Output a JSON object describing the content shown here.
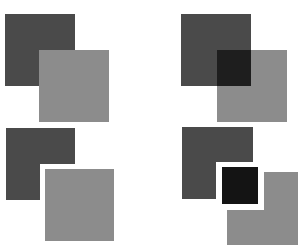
{
  "colors": {
    "background": "#ffffff",
    "dark": "#4a4a4a",
    "light": "#8c8c8c",
    "overlap": "#1e1e1e",
    "black": "#141414"
  },
  "panels": [
    {
      "name": "occlusion-light-over-dark",
      "description": "Light square occludes dark square",
      "shapes": [
        {
          "name": "dark-square",
          "x": 5,
          "y": 14,
          "w": 70,
          "h": 72,
          "fill": "dark"
        },
        {
          "name": "light-square",
          "x": 39,
          "y": 50,
          "w": 70,
          "h": 72,
          "fill": "light"
        }
      ]
    },
    {
      "name": "transparency-overlap",
      "description": "Two squares with darker overlap region",
      "shapes": [
        {
          "name": "dark-square",
          "x": 181,
          "y": 14,
          "w": 70,
          "h": 72,
          "fill": "dark"
        },
        {
          "name": "light-square",
          "x": 217,
          "y": 50,
          "w": 70,
          "h": 72,
          "fill": "light"
        },
        {
          "name": "overlap-region",
          "x": 217,
          "y": 50,
          "w": 34,
          "h": 36,
          "fill": "overlap"
        }
      ]
    },
    {
      "name": "separated-l-shape",
      "description": "Dark L-shape and light square separated by white gap",
      "shapes": [
        {
          "name": "dark-l-shape-top",
          "x": 6,
          "y": 128,
          "w": 69,
          "h": 36,
          "fill": "dark"
        },
        {
          "name": "dark-l-shape-bottom",
          "x": 6,
          "y": 164,
          "w": 34,
          "h": 36,
          "fill": "dark"
        },
        {
          "name": "light-square",
          "x": 45,
          "y": 169,
          "w": 69,
          "h": 72,
          "fill": "light"
        }
      ]
    },
    {
      "name": "separated-three-regions",
      "description": "Dark L-shape, black square and light L-shape separated by white gaps",
      "shapes": [
        {
          "name": "dark-l-shape-top",
          "x": 182,
          "y": 127,
          "w": 71,
          "h": 35,
          "fill": "dark"
        },
        {
          "name": "dark-l-shape-bottom",
          "x": 182,
          "y": 162,
          "w": 34,
          "h": 37,
          "fill": "dark"
        },
        {
          "name": "black-square",
          "x": 222,
          "y": 167,
          "w": 36,
          "h": 37,
          "fill": "black"
        },
        {
          "name": "light-l-shape-right",
          "x": 264,
          "y": 172,
          "w": 34,
          "h": 73,
          "fill": "light"
        },
        {
          "name": "light-l-shape-bottom",
          "x": 227,
          "y": 210,
          "w": 37,
          "h": 35,
          "fill": "light"
        }
      ]
    }
  ]
}
